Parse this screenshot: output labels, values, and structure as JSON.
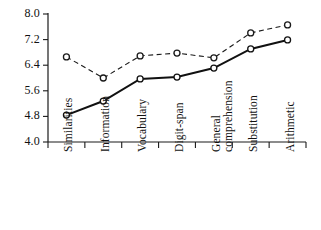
{
  "chart_data": {
    "type": "line",
    "title": "",
    "xlabel": "",
    "ylabel": "",
    "categories": [
      "Similarities",
      "Information",
      "Vocabulary",
      "Digit-span",
      "General comprehension",
      "Substitution",
      "Arithmetic"
    ],
    "category_lines": [
      [
        "Similarities"
      ],
      [
        "Information"
      ],
      [
        "Vocabulary"
      ],
      [
        "Digit-span"
      ],
      [
        "General",
        "comprehension"
      ],
      [
        "Substitution"
      ],
      [
        "Arithmetic"
      ]
    ],
    "series": [
      {
        "name": "dashed-series",
        "style": "dashed",
        "marker": "open-circle",
        "color": "#1a1a1a",
        "values": [
          6.66,
          6.0,
          6.69,
          6.78,
          6.63,
          7.41,
          7.66
        ]
      },
      {
        "name": "solid-series",
        "style": "solid",
        "marker": "open-circle",
        "color": "#111111",
        "values": [
          4.84,
          5.28,
          5.97,
          6.03,
          6.31,
          6.91,
          7.19
        ]
      }
    ],
    "ylim": [
      4.0,
      8.0
    ],
    "yticks": [
      4.0,
      5.6,
      6.4,
      7.2,
      8.0
    ],
    "ytick_labels": [
      "8.0",
      "7.2",
      "6.4",
      "5.6",
      "4.8",
      "4.0"
    ],
    "ytick_values": [
      8.0,
      7.2,
      6.4,
      5.6,
      4.8,
      4.0
    ],
    "grid": false,
    "legend": "none"
  },
  "axes": {
    "y_axis_name": "y-axis",
    "x_axis_name": "x-axis"
  }
}
